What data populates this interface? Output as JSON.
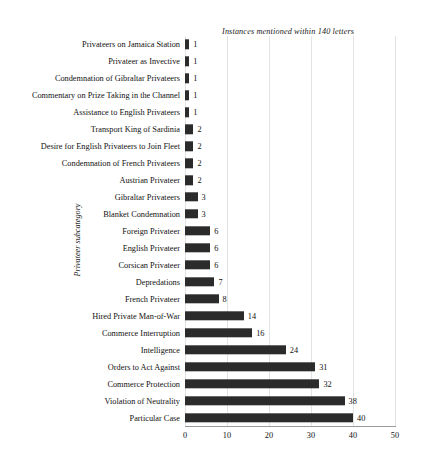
{
  "chart_data": {
    "type": "bar",
    "orientation": "horizontal",
    "title": "Instances mentioned within 140 letters",
    "xlabel": "",
    "ylabel": "Privateer subcategory",
    "xlim": [
      0,
      50
    ],
    "xticks": [
      0,
      10,
      20,
      30,
      40,
      50
    ],
    "grid": true,
    "legend": false,
    "bar_color": "#2b2b2b",
    "categories": [
      "Privateers on Jamaica Station",
      "Privateer as Invective",
      "Condemnation of Gibraltar Privateers",
      "Commentary on Prize Taking in the Channel",
      "Assistance to English Privateers",
      "Transport King of Sardinia",
      "Desire for English Privateers to Join Fleet",
      "Condemnation of French Privateers",
      "Austrian Privateer",
      "Gibraltar Privateers",
      "Blanket Condemnation",
      "Foreign Privateer",
      "English Privateer",
      "Corsican Privateer",
      "Depredations",
      "French Privateer",
      "Hired Private Man-of-War",
      "Commerce Interruption",
      "Intelligence",
      "Orders to Act Against",
      "Commerce Protection",
      "Violation of Neutrality",
      "Particular Case"
    ],
    "values": [
      1,
      1,
      1,
      1,
      1,
      2,
      2,
      2,
      2,
      3,
      3,
      6,
      6,
      6,
      7,
      8,
      14,
      16,
      24,
      31,
      32,
      38,
      40
    ]
  }
}
